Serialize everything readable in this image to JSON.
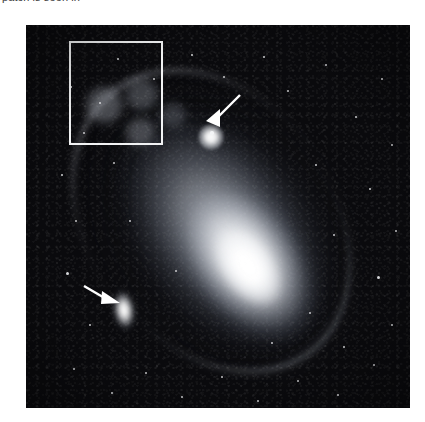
{
  "page": {
    "background_color": "#ffffff",
    "clipped_caption_text": "patch is seen in"
  },
  "plate": {
    "label": "andromeda-galaxy-photographic-plate",
    "background_color": "#0a0a0d",
    "left": 26,
    "top": 25,
    "width": 384,
    "height": 383
  },
  "annotations": {
    "region_box": {
      "label": "region-of-interest-box",
      "color": "#f2f3f4",
      "left": 69,
      "top": 41,
      "width": 94,
      "height": 104
    },
    "arrows": [
      {
        "label": "arrow-pointing-to-m32",
        "color": "#ffffff",
        "tail_x": 238,
        "tail_y": 92,
        "head_x": 204,
        "head_y": 128
      },
      {
        "label": "arrow-pointing-to-ngc205",
        "color": "#ffffff",
        "tail_x": 84,
        "tail_y": 283,
        "head_x": 112,
        "head_y": 301
      }
    ]
  },
  "objects": [
    {
      "label": "m31-nucleus",
      "center_x": 228,
      "center_y": 242
    },
    {
      "label": "m32-companion",
      "center_x": 211,
      "center_y": 137
    },
    {
      "label": "ngc205-companion",
      "center_x": 124,
      "center_y": 310
    }
  ],
  "stars": [
    {
      "x": 45,
      "y": 62,
      "r": 1.4
    },
    {
      "x": 58,
      "y": 108,
      "r": 1.1
    },
    {
      "x": 36,
      "y": 150,
      "r": 1.3
    },
    {
      "x": 50,
      "y": 196,
      "r": 1.0
    },
    {
      "x": 41,
      "y": 248,
      "r": 1.5
    },
    {
      "x": 64,
      "y": 300,
      "r": 1.1
    },
    {
      "x": 48,
      "y": 344,
      "r": 1.2
    },
    {
      "x": 86,
      "y": 368,
      "r": 1.3
    },
    {
      "x": 120,
      "y": 348,
      "r": 1.0
    },
    {
      "x": 156,
      "y": 372,
      "r": 1.2
    },
    {
      "x": 196,
      "y": 352,
      "r": 1.1
    },
    {
      "x": 232,
      "y": 376,
      "r": 1.3
    },
    {
      "x": 272,
      "y": 356,
      "r": 1.0
    },
    {
      "x": 312,
      "y": 370,
      "r": 1.4
    },
    {
      "x": 348,
      "y": 340,
      "r": 1.1
    },
    {
      "x": 366,
      "y": 300,
      "r": 1.2
    },
    {
      "x": 352,
      "y": 252,
      "r": 1.5
    },
    {
      "x": 370,
      "y": 206,
      "r": 1.1
    },
    {
      "x": 344,
      "y": 164,
      "r": 1.3
    },
    {
      "x": 366,
      "y": 120,
      "r": 1.0
    },
    {
      "x": 330,
      "y": 92,
      "r": 1.2
    },
    {
      "x": 356,
      "y": 54,
      "r": 1.4
    },
    {
      "x": 300,
      "y": 40,
      "r": 1.1
    },
    {
      "x": 262,
      "y": 66,
      "r": 1.0
    },
    {
      "x": 238,
      "y": 32,
      "r": 1.2
    },
    {
      "x": 198,
      "y": 52,
      "r": 1.1
    },
    {
      "x": 166,
      "y": 30,
      "r": 1.3
    },
    {
      "x": 128,
      "y": 54,
      "r": 1.0
    },
    {
      "x": 92,
      "y": 34,
      "r": 1.2
    },
    {
      "x": 74,
      "y": 78,
      "r": 1.0
    },
    {
      "x": 186,
      "y": 108,
      "r": 1.8
    },
    {
      "x": 290,
      "y": 140,
      "r": 1.2
    },
    {
      "x": 308,
      "y": 210,
      "r": 1.1
    },
    {
      "x": 284,
      "y": 288,
      "r": 1.0
    },
    {
      "x": 246,
      "y": 318,
      "r": 1.1
    },
    {
      "x": 150,
      "y": 246,
      "r": 1.0
    },
    {
      "x": 104,
      "y": 196,
      "r": 1.1
    },
    {
      "x": 88,
      "y": 138,
      "r": 1.0
    },
    {
      "x": 318,
      "y": 322,
      "r": 1.2
    },
    {
      "x": 210,
      "y": 384,
      "r": 1.0
    }
  ]
}
